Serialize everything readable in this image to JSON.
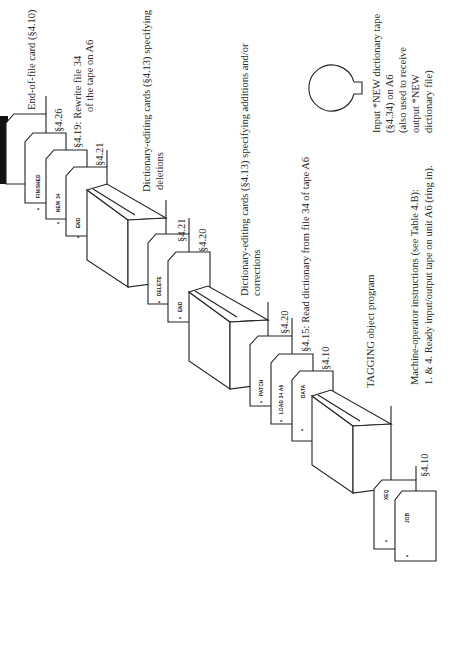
{
  "diagram": {
    "orientation": "rotated-90-ccw",
    "cards": [
      {
        "id": "finished",
        "label": "FINISHED",
        "star": "*",
        "ref": "§4.26"
      },
      {
        "id": "new34",
        "label": "NEW 34",
        "star": "*",
        "ref": "§4.19: Rewrite file 34",
        "ref2": "of the tape on A6"
      },
      {
        "id": "end1",
        "label": "END",
        "star": "*",
        "ref": "§4.21"
      },
      {
        "id": "delete",
        "label": "DELETE",
        "star": "*",
        "ref": "§4.21"
      },
      {
        "id": "end2",
        "label": "END",
        "star": "*",
        "ref": "§4.20"
      },
      {
        "id": "patch",
        "label": "PATCH",
        "star": "*",
        "ref": "§4.20"
      },
      {
        "id": "load",
        "label": "LOAD 34 A6",
        "star": "*",
        "ref": "§4.15: Read dictionary from file 34 of tape A6"
      },
      {
        "id": "data",
        "label": "DATA",
        "star": "*",
        "ref": "§4.10"
      },
      {
        "id": "xeq",
        "label": "XEQ",
        "star": "*",
        "ref": ""
      },
      {
        "id": "job",
        "label": "JOB",
        "star": "*",
        "ref": "§4.10"
      }
    ],
    "decks": [
      {
        "id": "deck-deletions",
        "label1": "Dictionary-editing cards (§4.13) specifying",
        "label2": "deletions"
      },
      {
        "id": "deck-additions",
        "label1": "Dictionary-editing cards (§4.13) specifying additions and/or",
        "label2": "corrections"
      },
      {
        "id": "deck-tagging",
        "label1": "TAGGING object program",
        "label2": ""
      }
    ],
    "end_of_file_card": "End-of-file card (§4.10)",
    "tape": {
      "lines": [
        "Input *NEW dictionary tape",
        "(§4.34) on A6",
        "(also used to receive",
        "output *NEW",
        "dictionary file)"
      ]
    },
    "machine_operator": {
      "line1": "Machine-operator instructions (see Table 4.B):",
      "line2": "1. & 4. Ready input/output tape on unit A6 (ring in)."
    }
  }
}
